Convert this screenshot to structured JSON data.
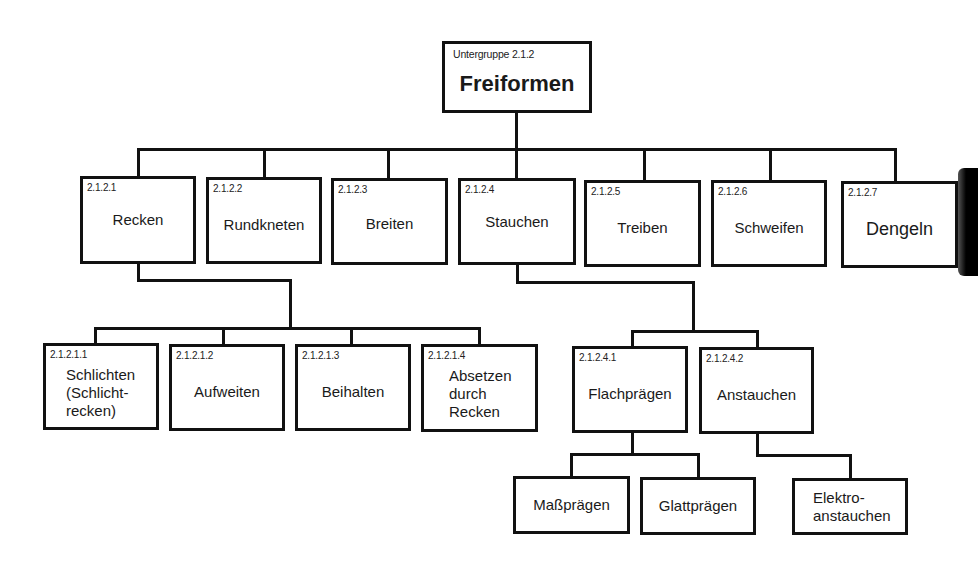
{
  "root": {
    "code": "Untergruppe 2.1.2",
    "label": "Freiformen"
  },
  "level1": [
    {
      "code": "2.1.2.1",
      "label": "Recken"
    },
    {
      "code": "2.1.2.2",
      "label": "Rundkneten"
    },
    {
      "code": "2.1.2.3",
      "label": "Breiten"
    },
    {
      "code": "2.1.2.4",
      "label": "Stauchen"
    },
    {
      "code": "2.1.2.5",
      "label": "Treiben"
    },
    {
      "code": "2.1.2.6",
      "label": "Schweifen"
    },
    {
      "code": "2.1.2.7",
      "label": "Dengeln"
    }
  ],
  "recken_children": [
    {
      "code": "2.1.2.1.1",
      "label_lines": [
        "Schlichten",
        "(Schlicht-",
        "recken)"
      ]
    },
    {
      "code": "2.1.2.1.2",
      "label": "Aufweiten"
    },
    {
      "code": "2.1.2.1.3",
      "label": "Beihalten"
    },
    {
      "code": "2.1.2.1.4",
      "label_lines": [
        "Absetzen",
        "durch",
        "Recken"
      ]
    }
  ],
  "stauchen_children": [
    {
      "code": "2.1.2.4.1",
      "label": "Flachprägen"
    },
    {
      "code": "2.1.2.4.2",
      "label": "Anstauchen"
    }
  ],
  "flachpraegen_children": [
    {
      "label": "Maßprägen"
    },
    {
      "label": "Glattprägen"
    }
  ],
  "anstauchen_children": [
    {
      "label_lines": [
        "Elektro-",
        "anstauchen"
      ]
    }
  ]
}
